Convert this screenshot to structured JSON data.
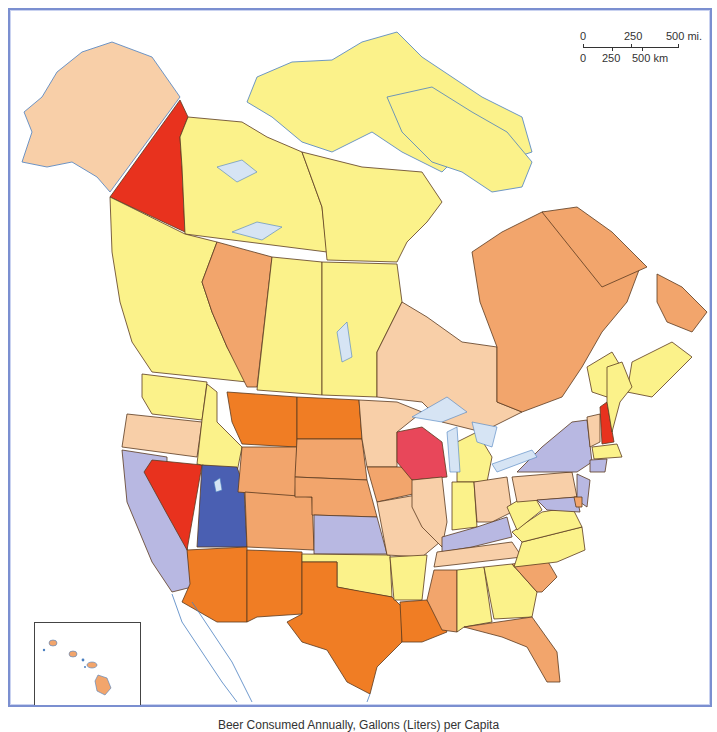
{
  "map": {
    "title": "Beer Consumed Annually, Gallons (Liters) per Capita",
    "region": "North America (USA and Canada)",
    "scale_bar": {
      "miles_labels": [
        "0",
        "250",
        "500 mi."
      ],
      "km_labels": [
        "0",
        "250",
        "500 km"
      ]
    },
    "inset": {
      "label": "Hawaii inset"
    },
    "colors": {
      "pale_yellow": "#fbf28a",
      "peach": "#f8cfa8",
      "light_orange": "#f2a56c",
      "orange": "#f07d24",
      "red": "#e8321e",
      "pink_red": "#e8475a",
      "lavender": "#b8b8e2",
      "blue": "#4a5fb2",
      "water": "#d6e4f4",
      "coast": "#4a7fc0",
      "border": "#5a3a20",
      "frame": "#7b8fd0"
    },
    "regions": [
      {
        "name": "Alaska",
        "color": "peach"
      },
      {
        "name": "Yukon",
        "color": "red"
      },
      {
        "name": "Northwest Territories",
        "color": "pale_yellow"
      },
      {
        "name": "Nunavut",
        "color": "pale_yellow"
      },
      {
        "name": "British Columbia",
        "color": "pale_yellow"
      },
      {
        "name": "Alberta",
        "color": "light_orange"
      },
      {
        "name": "Saskatchewan",
        "color": "pale_yellow"
      },
      {
        "name": "Manitoba",
        "color": "pale_yellow"
      },
      {
        "name": "Ontario",
        "color": "peach"
      },
      {
        "name": "Quebec",
        "color": "light_orange"
      },
      {
        "name": "Newfoundland and Labrador",
        "color": "light_orange"
      },
      {
        "name": "New Brunswick",
        "color": "pale_yellow"
      },
      {
        "name": "Nova Scotia",
        "color": "pale_yellow"
      },
      {
        "name": "Prince Edward Island",
        "color": "pale_yellow"
      },
      {
        "name": "Washington",
        "color": "pale_yellow"
      },
      {
        "name": "Oregon",
        "color": "peach"
      },
      {
        "name": "California",
        "color": "lavender"
      },
      {
        "name": "Nevada",
        "color": "red"
      },
      {
        "name": "Idaho",
        "color": "pale_yellow"
      },
      {
        "name": "Utah",
        "color": "blue"
      },
      {
        "name": "Arizona",
        "color": "orange"
      },
      {
        "name": "Montana",
        "color": "orange"
      },
      {
        "name": "Wyoming",
        "color": "light_orange"
      },
      {
        "name": "Colorado",
        "color": "light_orange"
      },
      {
        "name": "New Mexico",
        "color": "orange"
      },
      {
        "name": "North Dakota",
        "color": "orange"
      },
      {
        "name": "South Dakota",
        "color": "light_orange"
      },
      {
        "name": "Nebraska",
        "color": "light_orange"
      },
      {
        "name": "Kansas",
        "color": "lavender"
      },
      {
        "name": "Oklahoma",
        "color": "pale_yellow"
      },
      {
        "name": "Texas",
        "color": "orange"
      },
      {
        "name": "Minnesota",
        "color": "peach"
      },
      {
        "name": "Iowa",
        "color": "light_orange"
      },
      {
        "name": "Missouri",
        "color": "peach"
      },
      {
        "name": "Arkansas",
        "color": "pale_yellow"
      },
      {
        "name": "Louisiana",
        "color": "orange"
      },
      {
        "name": "Wisconsin",
        "color": "pink_red"
      },
      {
        "name": "Illinois",
        "color": "peach"
      },
      {
        "name": "Michigan",
        "color": "pale_yellow"
      },
      {
        "name": "Indiana",
        "color": "pale_yellow"
      },
      {
        "name": "Ohio",
        "color": "peach"
      },
      {
        "name": "Kentucky",
        "color": "lavender"
      },
      {
        "name": "Tennessee",
        "color": "peach"
      },
      {
        "name": "Mississippi",
        "color": "light_orange"
      },
      {
        "name": "Alabama",
        "color": "pale_yellow"
      },
      {
        "name": "Georgia",
        "color": "pale_yellow"
      },
      {
        "name": "Florida",
        "color": "light_orange"
      },
      {
        "name": "South Carolina",
        "color": "light_orange"
      },
      {
        "name": "North Carolina",
        "color": "pale_yellow"
      },
      {
        "name": "Virginia",
        "color": "pale_yellow"
      },
      {
        "name": "West Virginia",
        "color": "pale_yellow"
      },
      {
        "name": "Pennsylvania",
        "color": "peach"
      },
      {
        "name": "New York",
        "color": "lavender"
      },
      {
        "name": "New Jersey",
        "color": "lavender"
      },
      {
        "name": "Maryland",
        "color": "lavender"
      },
      {
        "name": "Delaware",
        "color": "light_orange"
      },
      {
        "name": "Vermont",
        "color": "peach"
      },
      {
        "name": "New Hampshire",
        "color": "red"
      },
      {
        "name": "Maine",
        "color": "pale_yellow"
      },
      {
        "name": "Massachusetts",
        "color": "pale_yellow"
      },
      {
        "name": "Connecticut",
        "color": "lavender"
      },
      {
        "name": "Hawaii",
        "color": "light_orange"
      }
    ]
  }
}
